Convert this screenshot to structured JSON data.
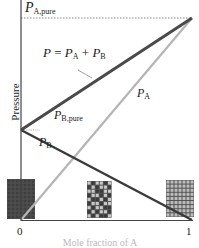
{
  "chart_data": {
    "type": "line",
    "title": "",
    "xlabel": "Mole fraction of A",
    "ylabel": "Pressure",
    "x_ticks": [
      "0",
      "1"
    ],
    "xlim": [
      0,
      1
    ],
    "grid": false,
    "legend": "inline labels",
    "series": [
      {
        "name": "P = PA + PB",
        "x": [
          0,
          1
        ],
        "y": [
          0.45,
          1.0
        ],
        "color": "#4a4a4a",
        "style": "thick solid"
      },
      {
        "name": "PA",
        "x": [
          0,
          1
        ],
        "y": [
          0.0,
          1.0
        ],
        "color": "#b8b8b8",
        "style": "solid"
      },
      {
        "name": "PB",
        "x": [
          0,
          1
        ],
        "y": [
          0.45,
          0.0
        ],
        "color": "#3a3a3a",
        "style": "solid"
      }
    ],
    "annotations": [
      {
        "text": "PA,pure",
        "at": "y=1.0 dotted reference line"
      },
      {
        "text": "PB,pure",
        "at": "x=0, y=0.45 dotted reference"
      },
      {
        "text": "P = PA + PB",
        "at": "total pressure line"
      }
    ],
    "composition_boxes": [
      {
        "position": "x=0",
        "description": "all dark (pure B)"
      },
      {
        "position": "x=0.5",
        "description": "mixed dark and light"
      },
      {
        "position": "x=1",
        "description": "all light (pure A)"
      }
    ]
  },
  "labels": {
    "pa_pure_main": "P",
    "pa_pure_sub": "A,pure",
    "total_p": "P",
    "total_eq": " = ",
    "total_pa": "P",
    "total_pa_sub": "A",
    "total_plus": " + ",
    "total_pb": "P",
    "total_pb_sub": "B",
    "pb_pure_main": "P",
    "pb_pure_sub": "B,pure",
    "pa_main": "P",
    "pa_sub": "A",
    "pb_main": "P",
    "pb_sub": "B",
    "ylabel": "Pressure",
    "xlabel": "Mole fraction of A",
    "tick_0": "0",
    "tick_1": "1"
  }
}
